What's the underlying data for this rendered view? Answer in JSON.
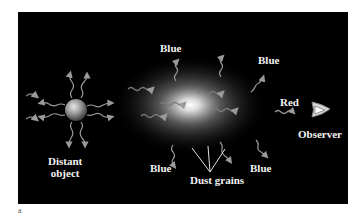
{
  "figure": {
    "panel_letter": "a",
    "labels": {
      "distant_object": [
        "Distant",
        "object"
      ],
      "blue_top_left": "Blue",
      "blue_top_right": "Blue",
      "blue_bottom_left": "Blue",
      "blue_bottom_right": "Blue",
      "red": "Red",
      "observer": "Observer",
      "dust_grains": "Dust grains"
    },
    "colors": {
      "background": "#000000",
      "text": "#f2f2f2",
      "wave": "#9a9a9a",
      "cloud_core": "#ffffff"
    }
  }
}
